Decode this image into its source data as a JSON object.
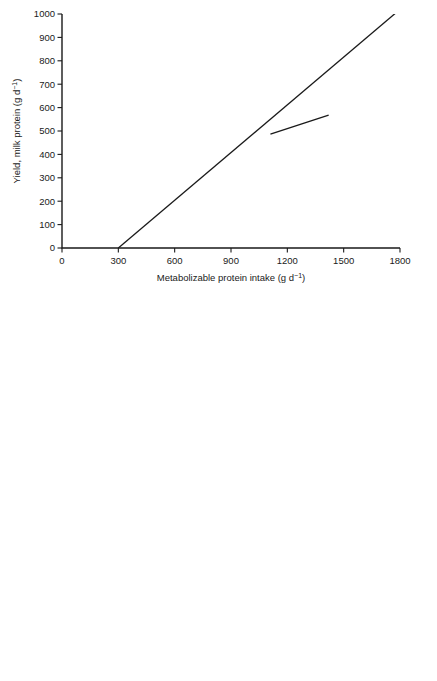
{
  "figure": {
    "panels": [
      "top",
      "bottom"
    ]
  },
  "chart_data": [
    {
      "id": "top",
      "type": "line",
      "title": "",
      "xlabel": "Metabolizable protein intake (g d⁻¹)",
      "ylabel": "Yield, milk protein (g d⁻¹)",
      "xlim": [
        0,
        1800
      ],
      "ylim": [
        0,
        1000
      ],
      "xticks": [
        0,
        300,
        600,
        900,
        1200,
        1500,
        1800
      ],
      "yticks": [
        0,
        100,
        200,
        300,
        400,
        500,
        600,
        700,
        800,
        900,
        1000
      ],
      "xticklabels": [
        "0",
        "300",
        "600",
        "900",
        "1200",
        "1500",
        "1800"
      ],
      "yticklabels": [
        "0",
        "100",
        "200",
        "300",
        "400",
        "500",
        "600",
        "700",
        "800",
        "900",
        "1000"
      ],
      "grid": false,
      "frame": "L-shaped",
      "legend": "none",
      "annotations": [
        {
          "text": "Slope = 0.68",
          "x": 1420,
          "y": 995
        }
      ],
      "reference_line": {
        "name": "slope-0.68-line",
        "slope": 0.68,
        "x_intercept": 300,
        "x_start": 300,
        "x_end": 1790,
        "y_start": 0,
        "y_end": 1013
      },
      "series": [
        {
          "name": "a",
          "label": "a",
          "marker": "filled-circle",
          "line_x": [
            1110,
            1420
          ],
          "line_y": [
            487,
            568
          ],
          "points_x": [
            1205
          ],
          "points_y": [
            518
          ],
          "label_x": 1448,
          "label_y": 570
        },
        {
          "name": "b",
          "label": "b",
          "marker": "filled-circle",
          "line_x": [
            1105,
            1555
          ],
          "line_y": [
            690,
            720
          ],
          "points_x": [
            1295,
            1490
          ],
          "points_y": [
            714,
            711
          ],
          "label_x": 1580,
          "label_y": 712
        },
        {
          "name": "c",
          "label": "c",
          "marker": "none",
          "line_x": [
            1110,
            1640
          ],
          "line_y": [
            617,
            752
          ],
          "points_x": [],
          "points_y": [],
          "label_x": 1665,
          "label_y": 757
        },
        {
          "name": "d",
          "label": "d",
          "marker": "filled-circle",
          "line_x": [
            1145,
            1745
          ],
          "line_y": [
            751,
            886
          ],
          "points_x": [
            1548
          ],
          "points_y": [
            828
          ],
          "label_x": 1768,
          "label_y": 890
        }
      ]
    },
    {
      "id": "bottom",
      "type": "scatter",
      "title": "",
      "xlabel": "Calculated metabolizable protein intake (g d⁻¹)",
      "ylabel": "Yield, milk protein (g d⁻¹)",
      "xlim": [
        0,
        2500
      ],
      "ylim": [
        0,
        1400
      ],
      "xticks": [
        0,
        500,
        1000,
        1500,
        2000,
        2500
      ],
      "yticks": [
        0,
        200,
        400,
        600,
        800,
        1000,
        1200,
        1400
      ],
      "xticklabels": [
        "0",
        "500",
        "1000",
        "1500",
        "2000",
        "2500"
      ],
      "yticklabels": [
        "0",
        "200",
        "400",
        "600",
        "800",
        "1000",
        "1200",
        "1400"
      ],
      "grid": false,
      "frame": "box",
      "legend": "none",
      "annotations": [
        {
          "text": "Slope = 0.68",
          "x": 2050,
          "y": 1330
        }
      ],
      "reference_line": {
        "name": "slope-0.68-line",
        "slope": 0.68,
        "x_intercept": 300,
        "x_start": 300,
        "x_end": 2360,
        "y_start": 0,
        "y_end": 1400
      },
      "series": [
        {
          "name": "cross-markers",
          "marker": "x",
          "points": [
            [
              1372,
              682
            ],
            [
              1520,
              727
            ],
            [
              1528,
              718
            ],
            [
              1533,
              740
            ],
            [
              1536,
              712
            ],
            [
              1546,
              745
            ],
            [
              1552,
              733
            ],
            [
              1578,
              752
            ],
            [
              1640,
              806
            ],
            [
              1720,
              841
            ],
            [
              1728,
              836
            ],
            [
              1790,
              808
            ]
          ]
        },
        {
          "name": "square-markers",
          "marker": "open-square",
          "points": [
            [
              1560,
              735
            ],
            [
              1650,
              789
            ],
            [
              1668,
              778
            ],
            [
              1718,
              838
            ],
            [
              1722,
              757
            ],
            [
              1785,
              788
            ],
            [
              1842,
              776
            ],
            [
              2048,
              806
            ],
            [
              2090,
              830
            ],
            [
              2125,
              857
            ],
            [
              2272,
              860
            ],
            [
              2352,
              874
            ]
          ]
        },
        {
          "name": "circle-markers",
          "marker": "open-circle",
          "points": [
            [
              1566,
              746
            ],
            [
              1650,
              793
            ],
            [
              1725,
              841
            ],
            [
              1752,
              833
            ],
            [
              1962,
              886
            ]
          ]
        }
      ]
    }
  ]
}
